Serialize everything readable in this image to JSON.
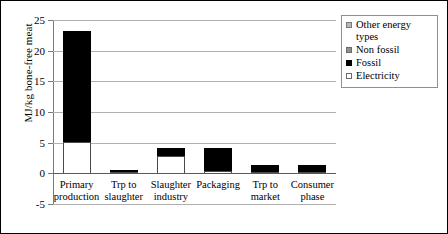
{
  "chart_data": {
    "type": "bar",
    "subtype": "stacked-bar",
    "title": "",
    "xlabel": "",
    "ylabel": "MJ/kg bone-free meat",
    "ylim": [
      -5,
      25
    ],
    "ytick_values": [
      25,
      20,
      15,
      10,
      5,
      0,
      -5
    ],
    "ytick_labels": [
      "25",
      "20",
      "15",
      "10",
      "5",
      "0",
      "-5"
    ],
    "grid": true,
    "legend_position": "top-right",
    "categories": [
      "Primary production",
      "Trp to slaughter",
      "Slaughter industry",
      "Packaging",
      "Trp to market",
      "Consumer phase"
    ],
    "category_lines": [
      [
        "Primary",
        "production"
      ],
      [
        "Trp to",
        "slaughter"
      ],
      [
        "Slaughter",
        "industry"
      ],
      [
        "Packaging",
        ""
      ],
      [
        "Trp to",
        "market"
      ],
      [
        "Consumer",
        "phase"
      ]
    ],
    "series": [
      {
        "name": "Electricity",
        "color": "#ffffff",
        "values": [
          5.0,
          0.15,
          2.8,
          0.4,
          0.1,
          0.1
        ]
      },
      {
        "name": "Fossil",
        "color": "#000000",
        "values": [
          18.2,
          0.35,
          1.2,
          3.6,
          1.2,
          1.2
        ]
      },
      {
        "name": "Non fossil",
        "color": "#909090",
        "values": [
          0,
          0,
          0,
          0,
          0,
          0
        ]
      },
      {
        "name": "Other energy types",
        "color": "#b8b8b8",
        "values": [
          0,
          0,
          0,
          0,
          0,
          0
        ]
      }
    ],
    "totals": [
      23.2,
      0.5,
      4.0,
      4.0,
      1.3,
      1.3
    ]
  },
  "legend": {
    "items": [
      {
        "label": "Other energy types",
        "swatch": "other-energy-types-swatch"
      },
      {
        "label": "Non fossil",
        "swatch": "non-fossil-swatch"
      },
      {
        "label": "Fossil",
        "swatch": "fossil-swatch"
      },
      {
        "label": "Electricity",
        "swatch": "electricity-swatch"
      }
    ]
  }
}
